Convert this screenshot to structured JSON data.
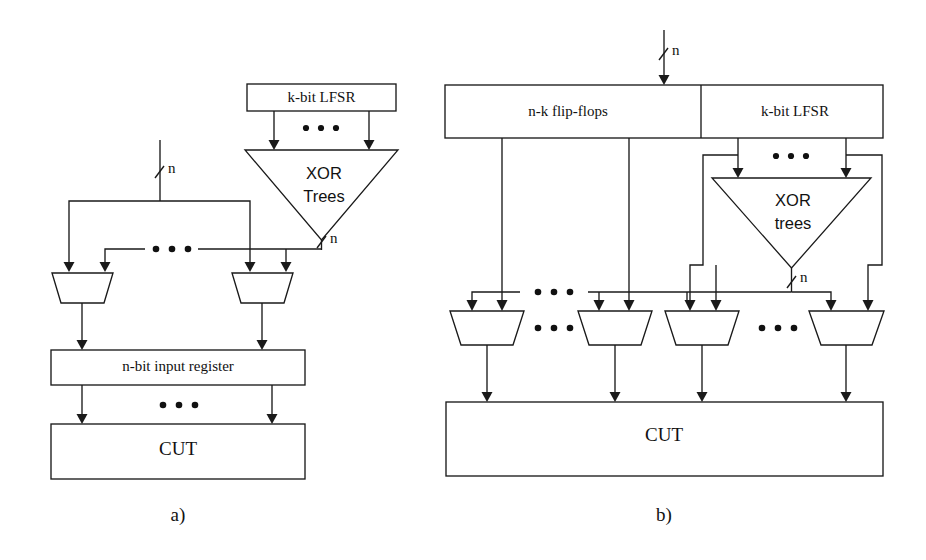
{
  "figure": {
    "kind": "block-diagram",
    "background_color": "#ffffff",
    "line_color": "#1a1a1a",
    "width": 926,
    "height": 560
  },
  "panel_a": {
    "caption": "a)",
    "blocks": {
      "lfsr": "k-bit LFSR",
      "xor_tree_line1": "XOR",
      "xor_tree_line2": "Trees",
      "input_register": "n-bit input register",
      "cut": "CUT"
    },
    "bus_labels": {
      "primary_input": "n",
      "xor_output": "n"
    },
    "ellipses": [
      "lfsr-to-xor-ellipsis",
      "mux-input-bus-ellipsis",
      "mux-row-ellipsis",
      "register-to-cut-ellipsis"
    ],
    "mux_count_shown": 2
  },
  "panel_b": {
    "caption": "b)",
    "blocks": {
      "flip_flops": "n-k flip-flops",
      "lfsr": "k-bit LFSR",
      "xor_tree_line1": "XOR",
      "xor_tree_line2": "trees",
      "cut": "CUT"
    },
    "bus_labels": {
      "primary_input": "n",
      "xor_output": "n"
    },
    "ellipses": [
      "lfsr-to-xor-ellipsis",
      "mux-input-bus-ellipsis-left",
      "mux-row-ellipsis-left",
      "mux-input-bus-ellipsis-right",
      "mux-row-ellipsis-right"
    ],
    "mux_count_shown": 4
  }
}
